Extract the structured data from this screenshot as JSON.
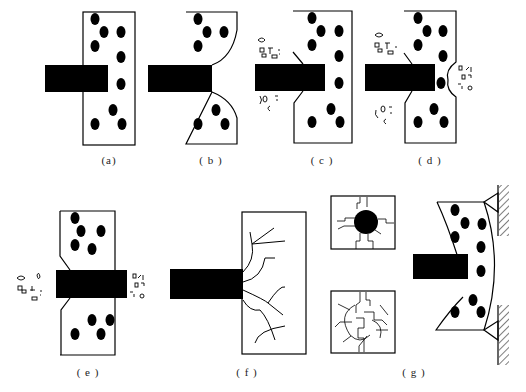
{
  "figure": {
    "colors": {
      "ink": "#000000",
      "background": "#ffffff"
    },
    "panels": [
      {
        "id": "a",
        "label": "(a)",
        "x": 109,
        "y": 164
      },
      {
        "id": "b",
        "label": "( b )",
        "x": 211,
        "y": 164
      },
      {
        "id": "c",
        "label": "( c )",
        "x": 322,
        "y": 164
      },
      {
        "id": "d",
        "label": "( d )",
        "x": 430,
        "y": 164
      },
      {
        "id": "e",
        "label": "( e )",
        "x": 88,
        "y": 376
      },
      {
        "id": "f",
        "label": "( f )",
        "x": 247,
        "y": 376
      },
      {
        "id": "g",
        "label": "( g )",
        "x": 414,
        "y": 376
      }
    ]
  }
}
